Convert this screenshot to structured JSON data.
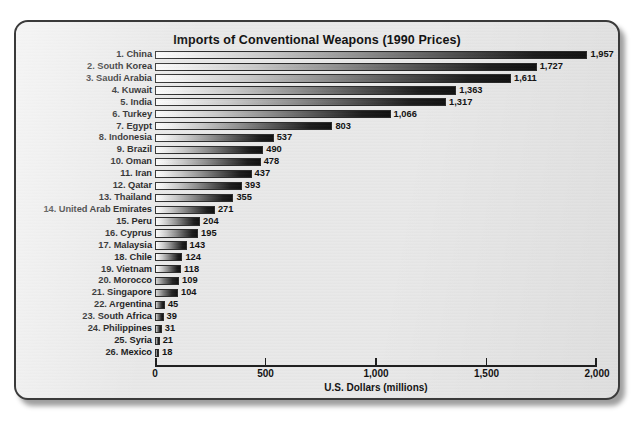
{
  "chart_data": {
    "type": "bar",
    "orientation": "horizontal",
    "title": "Imports of Conventional Weapons (1990 Prices)",
    "xlabel": "U.S. Dollars (millions)",
    "ylabel": "",
    "xlim": [
      0,
      2000
    ],
    "grid": false,
    "legend": null,
    "tick_labels": [
      "0",
      "500",
      "1,000",
      "1,500",
      "2,000"
    ],
    "ticks": [
      0,
      500,
      1000,
      1500,
      2000
    ],
    "categories": [
      "1. China",
      "2. South Korea",
      "3. Saudi Arabia",
      "4. Kuwait",
      "5. India",
      "6. Turkey",
      "7. Egypt",
      "8. Indonesia",
      "9. Brazil",
      "10. Oman",
      "11. Iran",
      "12. Qatar",
      "13. Thailand",
      "14. United Arab Emirates",
      "15. Peru",
      "16. Cyprus",
      "17. Malaysia",
      "18. Chile",
      "19. Vietnam",
      "20. Morocco",
      "21. Singapore",
      "22. Argentina",
      "23. South Africa",
      "24. Philippines",
      "25. Syria",
      "26. Mexico"
    ],
    "values": [
      1957,
      1727,
      1611,
      1363,
      1317,
      1066,
      803,
      537,
      490,
      478,
      437,
      393,
      355,
      271,
      204,
      195,
      143,
      124,
      118,
      109,
      104,
      45,
      39,
      31,
      21,
      18
    ],
    "value_labels": [
      "1,957",
      "1,727",
      "1,611",
      "1,363",
      "1,317",
      "1,066",
      "803",
      "537",
      "490",
      "478",
      "437",
      "393",
      "355",
      "271",
      "204",
      "195",
      "143",
      "124",
      "118",
      "109",
      "104",
      "45",
      "39",
      "31",
      "21",
      "18"
    ]
  },
  "style": {
    "card_background": "#e9e9e9",
    "page_background": "#ffffff",
    "bar_gradient_start": "#fbfbfb",
    "bar_gradient_end": "#111111",
    "text_color": "#111111",
    "axis_color": "#1d1d1d"
  }
}
